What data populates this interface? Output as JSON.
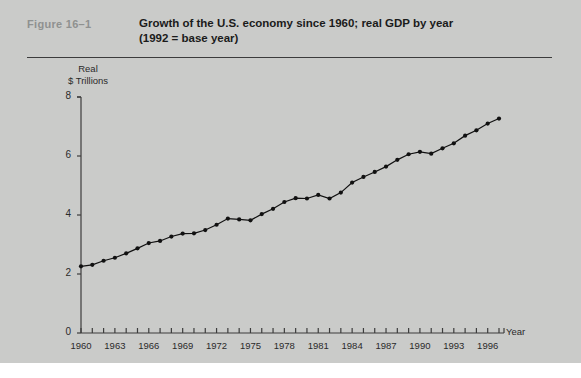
{
  "figure": {
    "label": "Figure  16–1",
    "title_line1": "Growth of the U.S. economy since 1960; real GDP by year",
    "title_line2": "(1992 = base year)"
  },
  "colors": {
    "background": "#cacbc9",
    "axis": "#3c3c3c",
    "line": "#111111",
    "marker": "#111111",
    "text": "#2a2a2a",
    "figure_label": "#8f9190"
  },
  "chart_data": {
    "type": "line",
    "title": "Growth of the U.S. economy since 1960; real GDP by year (1992 = base year)",
    "xlabel": "Year",
    "ylabel": "Real $ Trillions",
    "ylabel_line1": "Real",
    "ylabel_line2": "$ Trillions",
    "xlim": [
      1959,
      1998
    ],
    "ylim": [
      0,
      8
    ],
    "yticks": [
      0,
      2,
      4,
      6,
      8
    ],
    "ytick_labels": [
      "0",
      "2",
      "4",
      "6",
      "8"
    ],
    "xticks": [
      1960,
      1961,
      1962,
      1963,
      1964,
      1965,
      1966,
      1967,
      1968,
      1969,
      1970,
      1971,
      1972,
      1973,
      1974,
      1975,
      1976,
      1977,
      1978,
      1979,
      1980,
      1981,
      1982,
      1983,
      1984,
      1985,
      1986,
      1987,
      1988,
      1989,
      1990,
      1991,
      1992,
      1993,
      1994,
      1995,
      1996,
      1997
    ],
    "xtick_labels_shown": [
      "1960",
      "1963",
      "1966",
      "1969",
      "1972",
      "1975",
      "1978",
      "1981",
      "1984",
      "1987",
      "1990",
      "1993",
      "1996"
    ],
    "xtick_label_years": [
      1960,
      1963,
      1966,
      1969,
      1972,
      1975,
      1978,
      1981,
      1984,
      1987,
      1990,
      1993,
      1996
    ],
    "grid": false,
    "legend": false,
    "markers": true,
    "x": [
      1960,
      1961,
      1962,
      1963,
      1964,
      1965,
      1966,
      1967,
      1968,
      1969,
      1970,
      1971,
      1972,
      1973,
      1974,
      1975,
      1976,
      1977,
      1978,
      1979,
      1980,
      1981,
      1982,
      1983,
      1984,
      1985,
      1986,
      1987,
      1988,
      1989,
      1990,
      1991,
      1992,
      1993,
      1994,
      1995,
      1996,
      1997
    ],
    "values": [
      2.26,
      2.31,
      2.45,
      2.55,
      2.7,
      2.87,
      3.05,
      3.12,
      3.27,
      3.37,
      3.38,
      3.49,
      3.67,
      3.88,
      3.85,
      3.82,
      4.03,
      4.21,
      4.44,
      4.57,
      4.56,
      4.68,
      4.56,
      4.76,
      5.1,
      5.29,
      5.46,
      5.64,
      5.87,
      6.06,
      6.14,
      6.08,
      6.26,
      6.43,
      6.69,
      6.87,
      7.1,
      7.27
    ],
    "units": "trillions of 1992 dollars",
    "series_name": "Real GDP"
  }
}
